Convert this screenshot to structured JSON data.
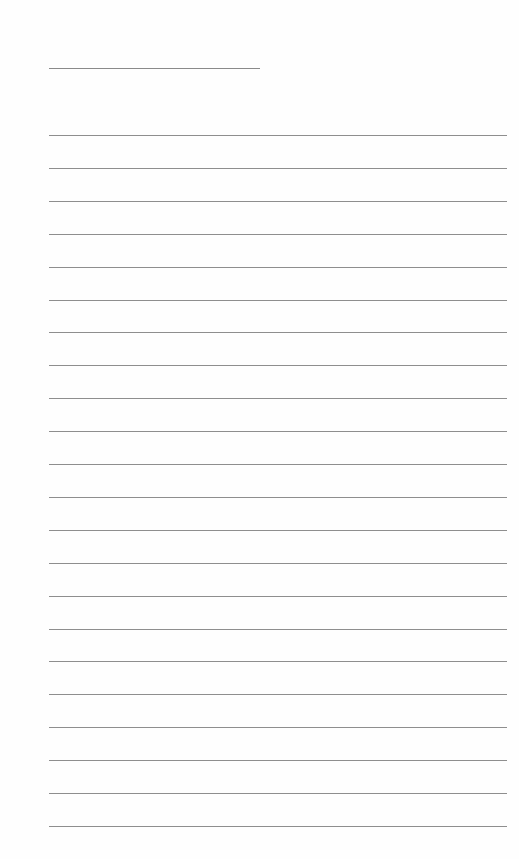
{
  "document": {
    "type": "lined-paper",
    "title_line": {
      "present": true,
      "label": ""
    },
    "rules": {
      "count": 22,
      "first_y": 135,
      "spacing": 32.9,
      "color": "#8e8e8e"
    }
  }
}
